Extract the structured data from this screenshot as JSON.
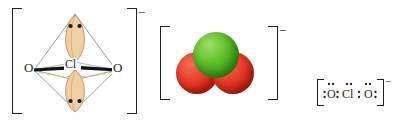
{
  "figure": {
    "species": "ClO2-",
    "charge_symbol": "−"
  },
  "colors": {
    "chlorine_green": "#4CB522",
    "oxygen_red": "#D9301C",
    "lobe_tan": "#F0C99A",
    "lobe_outline": "#B98A4E",
    "geometry_line_gray": "#9B9B9B",
    "bond_black": "#1A1A1A",
    "dashed_line_green": "#C9D66A",
    "ink": "#231F20"
  },
  "vsepr": {
    "name": "vsepr-trigonal-bipyramid",
    "central_atom": "Cl",
    "left_oxygen": "O",
    "right_oxygen": "O",
    "charge": "−",
    "lone_pair_count": 2,
    "lone_pair_positions": [
      "axial-top",
      "axial-bottom"
    ],
    "dots_per_lone_pair": 2,
    "bracket_left": "[",
    "bracket_right": "]"
  },
  "spacefill": {
    "name": "space-filling-model",
    "charge": "−",
    "atoms": [
      {
        "element": "Cl",
        "color": "#4CB522",
        "position": "top-center"
      },
      {
        "element": "O",
        "color": "#D9301C",
        "position": "bottom-left"
      },
      {
        "element": "O",
        "color": "#D9301C",
        "position": "bottom-right"
      }
    ],
    "bracket_left": "[",
    "bracket_right": "]"
  },
  "lewis": {
    "name": "lewis-structure",
    "charge": "−",
    "left_oxygen": "O",
    "center_chlorine": "Cl",
    "right_oxygen": "O",
    "left_outer_pair": ":",
    "left_inner_pair": ":",
    "right_inner_pair": ":",
    "right_outer_pair": ":",
    "top_dots_left_o": "¨",
    "top_dots_cl": "¨",
    "top_dots_right_o": "¨",
    "bracket_left": "[",
    "bracket_right": "]"
  }
}
